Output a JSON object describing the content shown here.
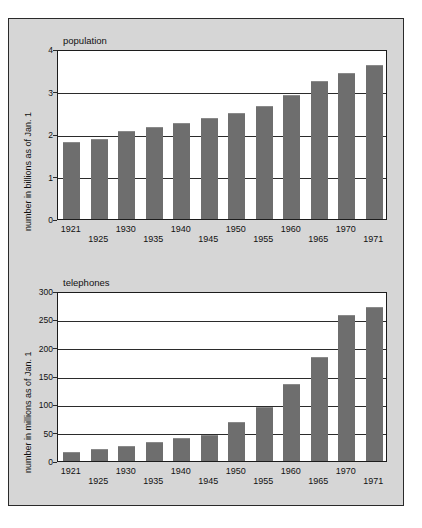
{
  "top_partial_text": "",
  "figure": {
    "background_color": "#d6d6d6",
    "bar_color": "#6e6e6e",
    "plot_background": "#ffffff",
    "border_color": "#1c1c1c"
  },
  "chart_data": [
    {
      "type": "bar",
      "title": "population",
      "xlabel": "",
      "ylabel": "number in billions as of Jan. 1",
      "ylim": [
        0,
        4
      ],
      "yticks": [
        0,
        1,
        2,
        3,
        4
      ],
      "grid": true,
      "legend": "none",
      "categories": [
        "1921",
        "1925",
        "1930",
        "1935",
        "1940",
        "1945",
        "1950",
        "1955",
        "1960",
        "1965",
        "1970",
        "1971"
      ],
      "values": [
        1.81,
        1.89,
        2.07,
        2.17,
        2.25,
        2.38,
        2.5,
        2.66,
        2.91,
        3.24,
        3.44,
        3.62
      ]
    },
    {
      "type": "bar",
      "title": "telephones",
      "xlabel": "",
      "ylabel": "number in millions as of Jan. 1",
      "ylim": [
        0,
        300
      ],
      "yticks": [
        0,
        50,
        100,
        150,
        200,
        250,
        300
      ],
      "grid": true,
      "legend": "none",
      "categories": [
        "1921",
        "1925",
        "1930",
        "1935",
        "1940",
        "1945",
        "1950",
        "1955",
        "1960",
        "1965",
        "1970",
        "1971"
      ],
      "values": [
        16,
        21,
        27,
        33,
        41,
        46,
        68,
        96,
        136,
        183,
        257,
        272
      ]
    }
  ]
}
